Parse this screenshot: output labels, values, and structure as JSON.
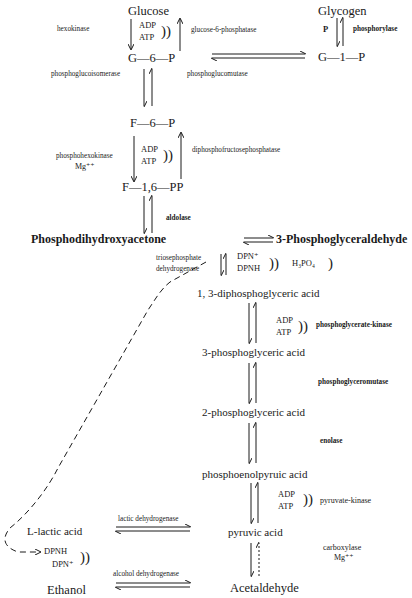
{
  "diagram": {
    "type": "metabolic-pathway",
    "nodes": {
      "glucose": "Glucose",
      "g6p": "G—6—P",
      "f6p": "F—6—P",
      "f16pp": "F—1,6—PP",
      "glycogen": "Glycogen",
      "g1p": "G—1—P",
      "dhap": "Phosphodihydroxyacetone",
      "g3p": "3-Phosphoglyceraldehyde",
      "bpg13": "1, 3-diphosphoglyceric acid",
      "pg3": "3-phosphoglyceric acid",
      "pg2": "2-phosphoglyceric acid",
      "pep": "phosphoenolpyruic acid",
      "pyruvate": "pyruvic acid",
      "acetaldehyde": "Acetaldehyde",
      "lactate": "L-lactic acid",
      "ethanol": "Ethanol"
    },
    "enzymes": {
      "hexokinase": "hexokinase",
      "glucose6phosphatase": "glucose-6-phosphatase",
      "phosphorylase": "phosphorylase",
      "phosphoglucoisomerase": "phosphoglucoisomerase",
      "phosphoglucomutase": "phosphoglucomutase",
      "phosphohexokinase": "phosphohexokinase",
      "phosphohexokinase_cofactor": "Mg⁺⁺",
      "diphosphofructosephosphatase": "diphosphofructosephosphatase",
      "aldolase": "aldolase",
      "triosephosphate_dh_1": "triosephosphate",
      "triosephosphate_dh_2": "dehydrogenase",
      "phosphoglycerate_kinase": "phosphoglycerate-kinase",
      "phosphoglyceromutase": "phosphoglyceromutase",
      "enolase": "enolase",
      "pyruvate_kinase": "pyruvate-kinase",
      "carboxylase": "carboxylase",
      "carboxylase_cofactor": "Mg⁺⁺",
      "lactic_dh": "lactic dehydrogenase",
      "alcohol_dh": "alcohol dehydrogenase"
    },
    "cofactors": {
      "adp": "ADP",
      "atp": "ATP",
      "p": "P",
      "dpn_plus": "DPN⁺",
      "dpnh": "DPNH",
      "h3po4": "H₃PO₄",
      "brace_pair": "))",
      "brace_single": ")"
    },
    "footer_fragment": "Fig. — The ... and the ... and the ..."
  }
}
